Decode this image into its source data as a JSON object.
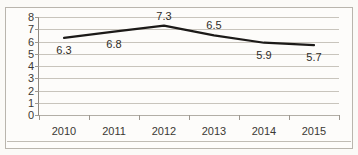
{
  "figure": {
    "title_sliver": "——— ———— ———",
    "background_color": "#fbfaf7",
    "frame_color": "#b9b5ad"
  },
  "chart_data": {
    "type": "line",
    "title": "",
    "xlabel": "",
    "ylabel": "",
    "categories": [
      "2010",
      "2011",
      "2012",
      "2013",
      "2014",
      "2015"
    ],
    "values": [
      6.3,
      6.8,
      7.3,
      6.5,
      5.9,
      5.7
    ],
    "point_labels": [
      "6.3",
      "6.8",
      "7.3",
      "6.5",
      "5.9",
      "5.7"
    ],
    "point_label_positions": [
      "below",
      "below",
      "above",
      "above",
      "below",
      "below"
    ],
    "ylim": [
      0,
      8
    ],
    "ytick_labels": [
      "8",
      "7",
      "6",
      "5",
      "4",
      "3",
      "2",
      "1",
      "0"
    ],
    "ytick_values": [
      8,
      7,
      6,
      5,
      4,
      3,
      2,
      1,
      0
    ],
    "grid": true,
    "legend": false,
    "series_color": "#1c1a18",
    "gridline_color": "#c8c4bc"
  }
}
